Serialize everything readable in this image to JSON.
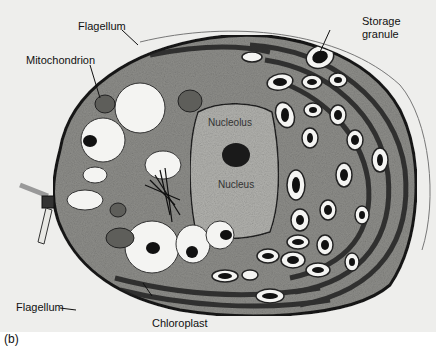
{
  "figure": {
    "panel_label": "(b)",
    "labels": {
      "flagellum_top": "Flagellum",
      "mitochondrion": "Mitochondrion",
      "storage_granule_line1": "Storage",
      "storage_granule_line2": "granule",
      "nucleolus": "Nucleolus",
      "nucleus": "Nucleus",
      "flagellum_bottom": "Flagellum",
      "chloroplast": "Chloroplast"
    },
    "colors": {
      "background": "#eeeeec",
      "cytoplasm": "#9a9a96",
      "membrane": "#1a1a1a",
      "vacuole": "#f4f4f2",
      "granule_core": "#111111"
    }
  }
}
